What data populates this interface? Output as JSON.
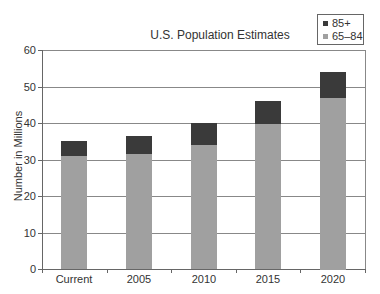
{
  "chart_data": {
    "type": "bar",
    "stacked": true,
    "title": "U.S. Population Estimates",
    "xlabel": "",
    "ylabel": "Number in Millions",
    "categories": [
      "Current",
      "2005",
      "2010",
      "2015",
      "2020"
    ],
    "series": [
      {
        "name": "65–84",
        "color": "#a0a0a0",
        "values": [
          31,
          31.5,
          34,
          39.7,
          47
        ]
      },
      {
        "name": "85+",
        "color": "#3a3a3a",
        "values": [
          4,
          5,
          6,
          6.3,
          7
        ]
      }
    ],
    "totals": [
      35,
      36.5,
      40,
      46,
      54
    ],
    "ylim": [
      0,
      60
    ],
    "yticks": [
      0,
      10,
      20,
      30,
      40,
      50,
      60
    ],
    "grid": true,
    "legend_position": "top-right"
  },
  "legend": {
    "items": [
      {
        "label": "85+",
        "color": "#3a3a3a"
      },
      {
        "label": "65–84",
        "color": "#a0a0a0"
      }
    ]
  }
}
